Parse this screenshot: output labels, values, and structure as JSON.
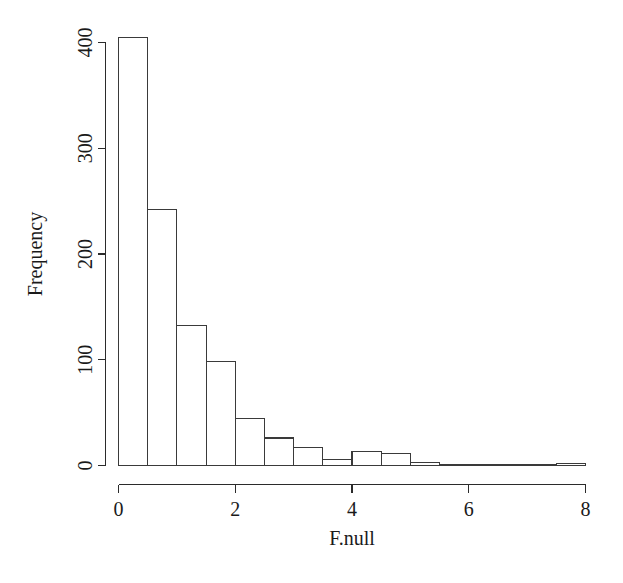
{
  "chart_data": {
    "type": "bar",
    "title": "",
    "subtitle": "",
    "xlabel": "F.null",
    "ylabel": "Frequency",
    "xlim": [
      0,
      8
    ],
    "ylim": [
      0,
      405
    ],
    "grid": false,
    "legend": null,
    "bin_width": 0.5,
    "x_ticks": [
      0,
      2,
      4,
      6,
      8
    ],
    "x_tick_labels": [
      "0",
      "2",
      "4",
      "6",
      "8"
    ],
    "y_ticks": [
      0,
      100,
      200,
      300,
      400
    ],
    "y_tick_labels": [
      "0",
      "100",
      "200",
      "300",
      "400"
    ],
    "bin_edges": [
      0,
      0.5,
      1.0,
      1.5,
      2.0,
      2.5,
      3.0,
      3.5,
      4.0,
      4.5,
      5.0,
      5.5,
      6.0,
      6.5,
      7.0,
      7.5,
      8.0
    ],
    "categories": [
      "0-0.5",
      "0.5-1",
      "1-1.5",
      "1.5-2",
      "2-2.5",
      "2.5-3",
      "3-3.5",
      "3.5-4",
      "4-4.5",
      "4.5-5",
      "5-5.5",
      "5.5-6",
      "6-6.5",
      "6.5-7",
      "7-7.5",
      "7.5-8"
    ],
    "values": [
      405,
      242,
      132,
      98,
      44,
      26,
      17,
      6,
      13,
      11,
      3,
      1,
      0,
      0,
      0,
      2
    ]
  },
  "axes": {
    "y_axis_label": "Frequency",
    "x_axis_label": "F.null"
  },
  "style": {
    "bar_fill": "#ffffff",
    "bar_stroke": "#3a3a3a",
    "axis_color": "#2b2b2b",
    "text_color": "#1a1a1a",
    "background": "#ffffff"
  }
}
